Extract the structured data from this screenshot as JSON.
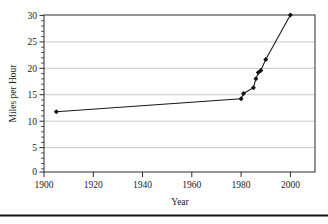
{
  "chart_data": {
    "type": "line",
    "title": "",
    "subtitle": "",
    "xlabel": "Year",
    "ylabel": "Miles per Hour",
    "xlim": [
      1900,
      2010
    ],
    "ylim": [
      0,
      30
    ],
    "grid": true,
    "legend": false,
    "legend_position": "none",
    "x_ticks": [
      1900,
      1920,
      1940,
      1960,
      1980,
      2000
    ],
    "x_tick_labels": [
      "1900",
      "1920",
      "1940",
      "1960",
      "1980",
      "2000"
    ],
    "y_ticks": [
      0,
      5,
      10,
      15,
      20,
      25,
      30
    ],
    "y_tick_labels": [
      "0",
      "5",
      "10",
      "15",
      "20",
      "25",
      "30"
    ],
    "marker": "diamond",
    "series": [
      {
        "name": "Miles per Hour",
        "x": [
          1905,
          1980,
          1981,
          1985,
          1986,
          1987,
          1988,
          1990,
          2000
        ],
        "values": [
          11.5,
          14.0,
          15.0,
          16.1,
          17.8,
          19.0,
          19.4,
          21.5,
          30.0
        ]
      }
    ],
    "annotations": []
  },
  "axes": {
    "x_axis_title": "Year",
    "y_axis_title": "Miles per Hour"
  },
  "footer": {
    "rule": ""
  }
}
